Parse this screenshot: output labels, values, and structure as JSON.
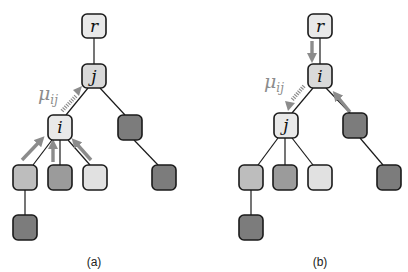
{
  "colors": {
    "light": "#e9e9e9",
    "child1": "#bdbdbd",
    "child2": "#9b9b9b",
    "child3": "#e1e1e1",
    "dark": "#7c7c7c",
    "arrow": "#8c8c8c"
  },
  "panel_a": {
    "caption": "(a)",
    "message_label": "μ",
    "message_sub": "ij",
    "nodes": {
      "root": "r",
      "parent": "j",
      "child": "i"
    }
  },
  "panel_b": {
    "caption": "(b)",
    "message_label": "μ",
    "message_sub": "ij",
    "nodes": {
      "root": "r",
      "parent": "i",
      "child": "j"
    }
  }
}
